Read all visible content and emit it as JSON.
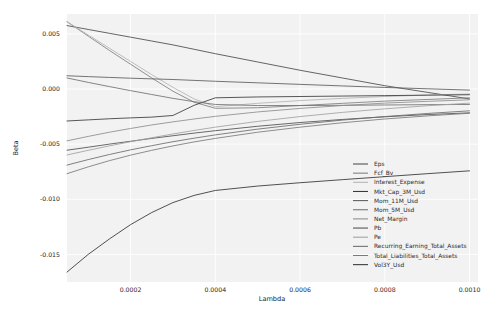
{
  "chart_data": {
    "type": "line",
    "title": "",
    "xlabel": "Lambda",
    "ylabel": "Beta",
    "xlim": [
      5e-05,
      0.00102
    ],
    "ylim": [
      -0.0175,
      0.0068
    ],
    "xticks": [
      0.0002,
      0.0004,
      0.0006,
      0.0008,
      0.001
    ],
    "xtick_labels": [
      "0.0002",
      "0.0004",
      "0.0006",
      "0.0008",
      "0.0010"
    ],
    "yticks": [
      0.005,
      0.0,
      -0.005,
      -0.01,
      -0.015
    ],
    "ytick_labels": [
      "0.005",
      "0.000",
      "-0.005",
      "-0.010",
      "-0.015"
    ],
    "grid": true,
    "legend_position": "lower right",
    "legend_entries": [
      "Eps",
      "Fcf_Bv",
      "Interest_Expense",
      "Mkt_Cap_3M_Usd",
      "Mom_11M_Usd",
      "Mom_5M_Usd",
      "Net_Margin",
      "Pb",
      "Pe",
      "Recurring_Earning_Total_Assets",
      "Total_Liabilities_Total_Assets",
      "Vol3Y_Usd"
    ],
    "x": [
      5e-05,
      0.0001,
      0.00015,
      0.0002,
      0.00025,
      0.0003,
      0.00035,
      0.0004,
      0.0005,
      0.0006,
      0.0007,
      0.0008,
      0.0009,
      0.001
    ],
    "series": [
      {
        "name": "Eps",
        "color": "#4a4a4a",
        "values": [
          0.00575,
          0.0054,
          0.00505,
          0.0047,
          0.00435,
          0.004,
          0.0036,
          0.0032,
          0.00245,
          0.0017,
          0.001,
          0.0003,
          -0.0003,
          -0.0009
        ]
      },
      {
        "name": "Fcf_Bv",
        "color": "#7d7d7d",
        "values": [
          0.0061,
          0.0048,
          0.0035,
          0.00225,
          0.001,
          -0.0002,
          -0.0012,
          -0.00175,
          -0.0017,
          -0.0015,
          -0.0013,
          -0.0011,
          -0.00095,
          -0.0008
        ]
      },
      {
        "name": "Interest_Expense",
        "color": "#b4b4b4",
        "values": [
          0.0061,
          0.0049,
          0.0037,
          0.0025,
          0.0013,
          0.00015,
          -0.0009,
          -0.0016,
          -0.0013,
          -0.00105,
          -0.00085,
          -0.00068,
          -0.00055,
          -0.00045
        ]
      },
      {
        "name": "Mkt_Cap_3M_Usd",
        "color": "#3a3a3a",
        "values": [
          -0.0029,
          -0.0028,
          -0.0027,
          -0.00262,
          -0.00255,
          -0.0024,
          -0.00148,
          -0.0008,
          -0.00072,
          -0.00068,
          -0.00064,
          -0.0006,
          -0.00056,
          -0.00052
        ]
      },
      {
        "name": "Mom_11M_Usd",
        "color": "#5c5c5c",
        "values": [
          0.0012,
          0.00112,
          0.00105,
          0.00098,
          0.00092,
          0.00086,
          0.00078,
          0.0007,
          0.00056,
          0.00042,
          0.00028,
          0.00014,
          2e-05,
          -0.0001
        ]
      },
      {
        "name": "Mom_5M_Usd",
        "color": "#707070",
        "values": [
          0.001,
          0.0006,
          0.00022,
          -0.00015,
          -0.0005,
          -0.00085,
          -0.00115,
          -0.0014,
          -0.0015,
          -0.0015,
          -0.00148,
          -0.00145,
          -0.00142,
          -0.0014
        ]
      },
      {
        "name": "Net_Margin",
        "color": "#8c8c8c",
        "values": [
          -0.0047,
          -0.0043,
          -0.00392,
          -0.00358,
          -0.00326,
          -0.00298,
          -0.00272,
          -0.00248,
          -0.00208,
          -0.00176,
          -0.0015,
          -0.00128,
          -0.00112,
          -0.00098
        ]
      },
      {
        "name": "Pb",
        "color": "#4f4f4f",
        "values": [
          -0.00555,
          -0.00528,
          -0.005,
          -0.00474,
          -0.00448,
          -0.00424,
          -0.004,
          -0.00378,
          -0.00338,
          -0.00304,
          -0.00276,
          -0.00252,
          -0.00232,
          -0.00216
        ]
      },
      {
        "name": "Pe",
        "color": "#a0a0a0",
        "values": [
          -0.00598,
          -0.00556,
          -0.00516,
          -0.00478,
          -0.00442,
          -0.00408,
          -0.00376,
          -0.00346,
          -0.00294,
          -0.0025,
          -0.00212,
          -0.0018,
          -0.00152,
          -0.00128
        ]
      },
      {
        "name": "Recurring_Earning_Total_Assets",
        "color": "#6b6b6b",
        "values": [
          -0.0069,
          -0.0064,
          -0.00594,
          -0.00552,
          -0.00514,
          -0.00478,
          -0.00446,
          -0.00416,
          -0.00364,
          -0.0032,
          -0.00282,
          -0.0025,
          -0.00222,
          -0.00198
        ]
      },
      {
        "name": "Total_Liabilities_Total_Assets",
        "color": "#7a7a7a",
        "values": [
          -0.00768,
          -0.00706,
          -0.0065,
          -0.006,
          -0.00556,
          -0.00516,
          -0.0048,
          -0.00448,
          -0.00392,
          -0.00346,
          -0.00306,
          -0.00272,
          -0.00244,
          -0.0022
        ]
      },
      {
        "name": "Vol3Y_Usd",
        "color": "#333333",
        "values": [
          -0.0166,
          -0.015,
          -0.0136,
          -0.0123,
          -0.0112,
          -0.0103,
          -0.00965,
          -0.0092,
          -0.0088,
          -0.0085,
          -0.00822,
          -0.00795,
          -0.00768,
          -0.00742
        ]
      }
    ]
  }
}
